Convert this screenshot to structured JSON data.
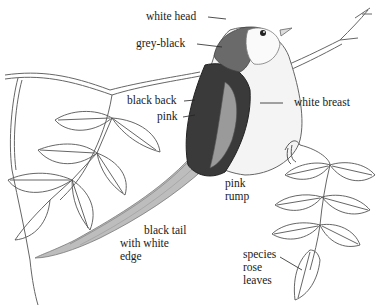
{
  "figure": {
    "style": "pencil sketch"
  },
  "labels": [
    {
      "id": "white-head",
      "text": "white head",
      "x": 146,
      "y": 10
    },
    {
      "id": "grey-black",
      "text": "grey-black",
      "x": 136,
      "y": 38
    },
    {
      "id": "black-back",
      "text": "black back",
      "x": 127,
      "y": 95
    },
    {
      "id": "pink",
      "text": "pink",
      "x": 157,
      "y": 111
    },
    {
      "id": "white-breast",
      "text": "white breast",
      "x": 294,
      "y": 96
    },
    {
      "id": "pink-rump",
      "text": "pink\nrump",
      "x": 225,
      "y": 177
    },
    {
      "id": "black-tail",
      "text": "black tail\nwith white\nedge",
      "x": 120,
      "y": 225
    },
    {
      "id": "species-rose-leaves",
      "text": "species\nrose\nleaves",
      "x": 243,
      "y": 248
    }
  ],
  "colors": {
    "ink": "#1a1a1a",
    "pencil": "#555555",
    "dark": "#2b2b2b",
    "grey": "#8a8a8a",
    "paper": "#ffffff"
  }
}
